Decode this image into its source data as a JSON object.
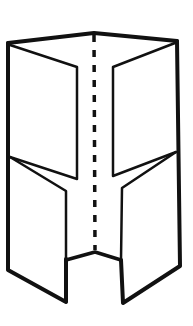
{
  "diagram": {
    "type": "folded-leaflet-illustration",
    "colors": {
      "stroke": "#111111",
      "background": "#ffffff"
    }
  }
}
